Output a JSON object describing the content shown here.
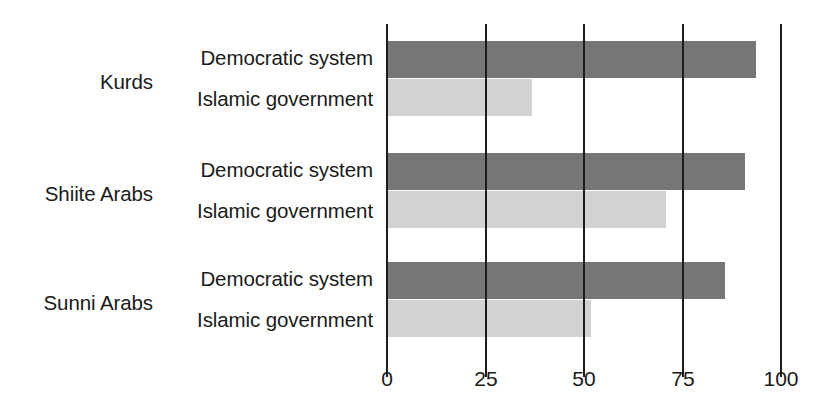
{
  "chart_data": {
    "type": "bar",
    "orientation": "horizontal",
    "title": "",
    "subtitle": "",
    "xlabel": "",
    "ylabel": "",
    "xlim": [
      0,
      100
    ],
    "ylim": null,
    "grid": true,
    "legend": null,
    "xticks": [
      0,
      25,
      50,
      75,
      100
    ],
    "xtick_labels": [
      "0",
      "25",
      "50",
      "75",
      "100"
    ],
    "categories": [
      "Kurds",
      "Shiite Arabs",
      "Sunni Arabs"
    ],
    "series": [
      {
        "name": "Democratic system",
        "color": "#767676",
        "values": [
          94,
          91,
          86
        ]
      },
      {
        "name": "Islamic government",
        "color": "#d2d2d2",
        "values": [
          37,
          71,
          52
        ]
      }
    ],
    "groups": [
      {
        "category": "Kurds",
        "bars": [
          {
            "label": "Democratic system",
            "value": 94,
            "color": "#767676"
          },
          {
            "label": "Islamic government",
            "value": 37,
            "color": "#d2d2d2"
          }
        ]
      },
      {
        "category": "Shiite Arabs",
        "bars": [
          {
            "label": "Democratic system",
            "value": 91,
            "color": "#767676"
          },
          {
            "label": "Islamic government",
            "value": 71,
            "color": "#d2d2d2"
          }
        ]
      },
      {
        "category": "Sunni Arabs",
        "bars": [
          {
            "label": "Democratic system",
            "value": 86,
            "color": "#767676"
          },
          {
            "label": "Islamic government",
            "value": 52,
            "color": "#d2d2d2"
          }
        ]
      }
    ]
  },
  "axis": {
    "ticks": [
      {
        "value": 0,
        "label": "0"
      },
      {
        "value": 25,
        "label": "25"
      },
      {
        "value": 50,
        "label": "50"
      },
      {
        "value": 75,
        "label": "75"
      },
      {
        "value": 100,
        "label": "100"
      }
    ]
  },
  "labels": {
    "groups": [
      {
        "name": "Kurds"
      },
      {
        "name": "Shiite Arabs"
      },
      {
        "name": "Sunni Arabs"
      }
    ],
    "series": [
      {
        "name": "Democratic system"
      },
      {
        "name": "Islamic government"
      }
    ]
  },
  "colors": {
    "democratic_bar": "#767676",
    "islamic_bar": "#d2d2d2",
    "gridline": "#1c1c1c",
    "text": "#1a1a1a",
    "background": "#ffffff"
  }
}
